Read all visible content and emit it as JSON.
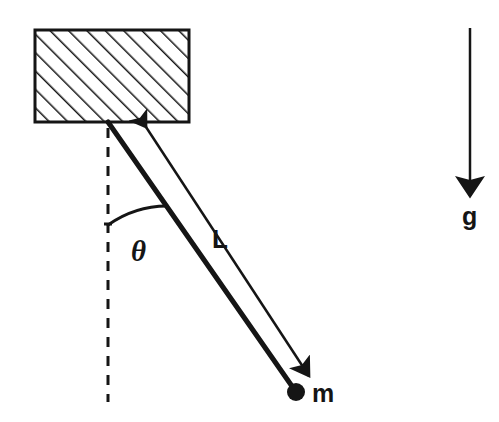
{
  "figure": {
    "kind": "simple-pendulum-free-body-diagram",
    "background_color": "#ffffff",
    "ink_color": "#151515",
    "width": 499,
    "height": 422
  },
  "labels": {
    "angle": "θ",
    "length": "L",
    "mass": "m",
    "gravity": "g"
  },
  "elements": {
    "support_block": {
      "name": "hatched ceiling support",
      "x": 35,
      "y": 30,
      "width": 154,
      "height": 92,
      "hatch_angle_deg": 45,
      "hatch_spacing": 13,
      "border_width": 3
    },
    "pivot": {
      "x": 108,
      "y": 122
    },
    "rod": {
      "from_x": 108,
      "from_y": 122,
      "to_x": 296,
      "to_y": 392,
      "stroke_width": 5
    },
    "bob": {
      "cx": 296,
      "cy": 392,
      "r": 9
    },
    "vertical_dashed_reference": {
      "x": 108,
      "from_y": 128,
      "to_y": 402,
      "dash": 10,
      "gap": 9,
      "stroke_width": 3
    },
    "angle_arc": {
      "center_x": 108,
      "center_y": 122,
      "radius": 103,
      "start_deg": 90,
      "end_deg": 55,
      "stroke_width": 3
    },
    "length_arrow": {
      "from_x": 146,
      "from_y": 124,
      "to_x": 312,
      "to_y": 380,
      "stroke_width": 2,
      "double_headed": true
    },
    "gravity_arrow": {
      "x": 470,
      "from_y": 28,
      "to_y": 200,
      "stroke_width": 2
    }
  }
}
